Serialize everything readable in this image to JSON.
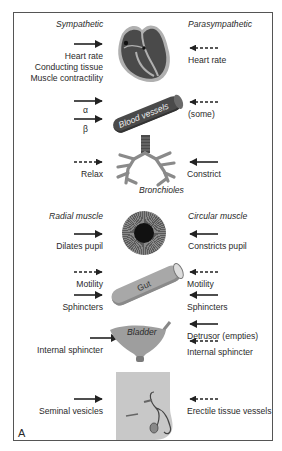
{
  "figure": {
    "panel_label": "A",
    "headers": {
      "sympathetic": "Sympathetic",
      "parasympathetic": "Parasympathetic"
    },
    "organs": {
      "heart": {
        "sympathetic": [
          "Heart rate",
          "Conducting tissue",
          "Muscle contractility"
        ],
        "sympathetic_arrow": "solid",
        "parasympathetic": [
          "Heart rate"
        ],
        "parasympathetic_arrow": "dashed"
      },
      "blood_vessels": {
        "label": "Blood vessels",
        "sympathetic": [
          "α",
          "β"
        ],
        "sympathetic_arrow": "solid",
        "parasympathetic": [
          "(some)"
        ],
        "parasympathetic_arrow": "dashed"
      },
      "bronchioles": {
        "label": "Bronchioles",
        "sympathetic": [
          "Relax"
        ],
        "sympathetic_arrow": "dashed",
        "parasympathetic": [
          "Constrict"
        ],
        "parasympathetic_arrow": "solid"
      },
      "eye": {
        "sympathetic_header": "Radial muscle",
        "parasympathetic_header": "Circular muscle",
        "sympathetic": [
          "Dilates pupil"
        ],
        "sympathetic_arrow": "solid",
        "parasympathetic": [
          "Constricts pupil"
        ],
        "parasympathetic_arrow": "solid"
      },
      "gut": {
        "label": "Gut",
        "sympathetic": [
          "Motility",
          "Sphincters"
        ],
        "sympathetic_arrows": [
          "dashed",
          "solid"
        ],
        "parasympathetic": [
          "Motility",
          "Sphincters"
        ],
        "parasympathetic_arrows": [
          "dashed",
          "solid"
        ]
      },
      "bladder": {
        "label": "Bladder",
        "sympathetic": [
          "Internal sphincter"
        ],
        "sympathetic_arrow": "solid",
        "parasympathetic": [
          "Detrusor (empties)",
          "Internal sphincter"
        ],
        "parasympathetic_arrows": [
          "solid",
          "dashed"
        ]
      },
      "reproductive": {
        "sympathetic": [
          "Seminal vesicles"
        ],
        "sympathetic_arrow": "solid",
        "parasympathetic": [
          "Erectile tissue vessels"
        ],
        "parasympathetic_arrow": "dashed"
      }
    },
    "colors": {
      "frame": "#555555",
      "organ_dark": "#4a4a4a",
      "organ_mid": "#8a8a8a",
      "organ_light": "#b5b5b5",
      "text": "#2a2a2a"
    }
  }
}
